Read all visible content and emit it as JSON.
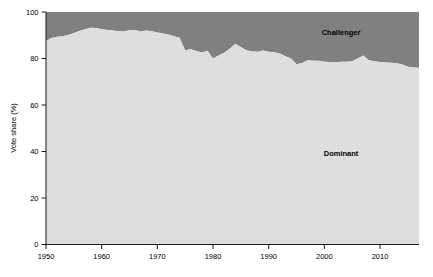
{
  "chart_data": {
    "type": "area",
    "title": "",
    "subtitle": "",
    "xlabel": "",
    "ylabel": "Vote share (%)",
    "xlim": [
      1950,
      2017
    ],
    "ylim": [
      0,
      100
    ],
    "grid": false,
    "stacked": true,
    "legend_position": "inline-annotations",
    "xticks": [
      1950,
      1960,
      1970,
      1980,
      1990,
      2000,
      2010
    ],
    "xtick_labels": [
      "1950",
      "1960",
      "1970",
      "1980",
      "1990",
      "2000",
      "2010"
    ],
    "yticks": [
      0,
      20,
      40,
      60,
      80,
      100
    ],
    "ytick_labels": [
      "0",
      "20",
      "40",
      "60",
      "80",
      "100"
    ],
    "colors": {
      "dominant": "#dedede",
      "challenger": "#808080",
      "axis": "#000000",
      "text": "#000000",
      "background": "#ffffff"
    },
    "annotations": [
      {
        "text": "Challenger",
        "x": 2003,
        "y": 90
      },
      {
        "text": "Dominant",
        "x": 2003,
        "y": 38
      }
    ],
    "x": [
      1950,
      1951,
      1952,
      1953,
      1954,
      1955,
      1956,
      1957,
      1958,
      1959,
      1960,
      1961,
      1962,
      1963,
      1964,
      1965,
      1966,
      1967,
      1968,
      1969,
      1970,
      1971,
      1972,
      1973,
      1974,
      1975,
      1976,
      1977,
      1978,
      1979,
      1980,
      1981,
      1982,
      1983,
      1984,
      1985,
      1986,
      1987,
      1988,
      1989,
      1990,
      1991,
      1992,
      1993,
      1994,
      1995,
      1996,
      1997,
      1998,
      1999,
      2000,
      2001,
      2002,
      2003,
      2004,
      2005,
      2006,
      2007,
      2008,
      2009,
      2010,
      2011,
      2012,
      2013,
      2014,
      2015,
      2016,
      2017
    ],
    "series": [
      {
        "name": "Dominant",
        "values": [
          87.5,
          88.8,
          89.4,
          89.6,
          90.1,
          91.0,
          91.8,
          92.6,
          93.2,
          93.1,
          92.6,
          92.3,
          92.0,
          91.7,
          91.6,
          92.1,
          92.3,
          91.6,
          92.0,
          91.7,
          91.2,
          90.8,
          90.3,
          89.6,
          88.9,
          83.5,
          84.0,
          83.2,
          82.6,
          83.3,
          80.0,
          81.3,
          82.5,
          84.2,
          86.2,
          85.0,
          83.5,
          83.0,
          82.9,
          83.4,
          82.9,
          82.7,
          82.2,
          81.0,
          80.0,
          77.5,
          78.1,
          79.2,
          79.0,
          79.0,
          78.6,
          78.5,
          78.4,
          78.6,
          78.6,
          78.8,
          80.0,
          81.3,
          79.3,
          78.8,
          78.5,
          78.3,
          78.2,
          78.0,
          77.4,
          76.4,
          76.1,
          76.0
        ]
      },
      {
        "name": "Challenger",
        "values": [
          12.5,
          11.2,
          10.6,
          10.4,
          9.9,
          9.0,
          8.2,
          7.4,
          6.8,
          6.9,
          7.4,
          7.7,
          8.0,
          8.3,
          8.4,
          7.9,
          7.7,
          8.4,
          8.0,
          8.3,
          8.8,
          9.2,
          9.7,
          10.4,
          11.1,
          16.5,
          16.0,
          16.8,
          17.4,
          16.7,
          20.0,
          18.7,
          17.5,
          15.8,
          13.8,
          15.0,
          16.5,
          17.0,
          17.1,
          16.6,
          17.1,
          17.3,
          17.8,
          19.0,
          20.0,
          22.5,
          21.9,
          20.8,
          21.0,
          21.0,
          21.4,
          21.5,
          21.6,
          21.4,
          21.4,
          21.2,
          20.0,
          18.7,
          20.7,
          21.2,
          21.5,
          21.7,
          21.8,
          22.0,
          22.6,
          23.6,
          23.9,
          24.0
        ]
      }
    ]
  }
}
